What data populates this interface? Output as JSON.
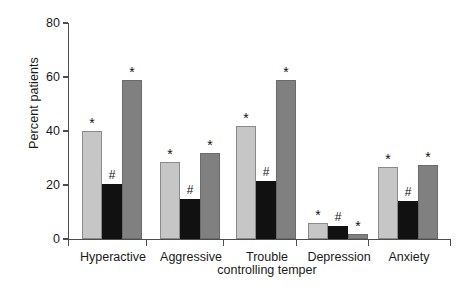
{
  "chart_data": {
    "type": "bar",
    "title": "",
    "xlabel": "",
    "ylabel": "Percent patients",
    "ylim": [
      0,
      80
    ],
    "yticks": [
      0,
      20,
      40,
      60,
      80
    ],
    "grid": false,
    "legend": "none",
    "categories": [
      "Hyperactive",
      "Aggressive",
      "Trouble controlling temper",
      "Depression",
      "Anxiety"
    ],
    "category_lines": [
      [
        "Hyperactive",
        ""
      ],
      [
        "Aggressive",
        ""
      ],
      [
        "Trouble",
        "controlling temper"
      ],
      [
        "Depression",
        ""
      ],
      [
        "Anxiety",
        ""
      ]
    ],
    "series": [
      {
        "name": "light-gray",
        "color": "#c6c6c6",
        "values": [
          40,
          28.5,
          42,
          6,
          26.5
        ],
        "markers": [
          "*",
          "*",
          "*",
          "*",
          "*"
        ]
      },
      {
        "name": "black",
        "color": "#111111",
        "values": [
          20.5,
          15,
          21.5,
          5,
          14
        ],
        "markers": [
          "#",
          "#",
          "#",
          "#",
          "#"
        ]
      },
      {
        "name": "dark-gray",
        "color": "#808080",
        "values": [
          59,
          32,
          59,
          2,
          27.5
        ],
        "markers": [
          "*",
          "*",
          "*",
          "*",
          "*"
        ]
      }
    ]
  }
}
